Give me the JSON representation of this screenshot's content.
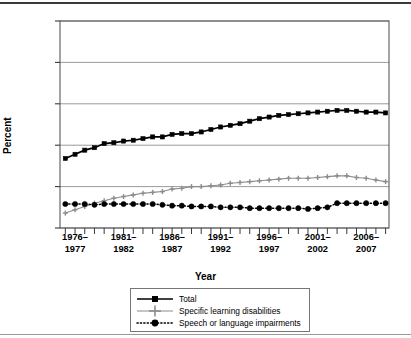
{
  "chart_data": {
    "type": "line",
    "title": "",
    "xlabel": "Year",
    "ylabel": "Percent",
    "ylim": [
      0,
      25
    ],
    "yticks": [
      0,
      5,
      10,
      15,
      20,
      25
    ],
    "grid": "horizontal",
    "legend_position": "below-plot",
    "x_tick_labels": [
      {
        "line1": "1976–",
        "line2": "1977"
      },
      {
        "line1": "1981–",
        "line2": "1982"
      },
      {
        "line1": "1986–",
        "line2": "1987"
      },
      {
        "line1": "1991–",
        "line2": "1992"
      },
      {
        "line1": "1996–",
        "line2": "1997"
      },
      {
        "line1": "2001–",
        "line2": "2002"
      },
      {
        "line1": "2006–",
        "line2": "2007"
      }
    ],
    "x": [
      "1975-76",
      "1976-77",
      "1977-78",
      "1978-79",
      "1979-80",
      "1980-81",
      "1981-82",
      "1982-83",
      "1983-84",
      "1984-85",
      "1985-86",
      "1986-87",
      "1987-88",
      "1988-89",
      "1989-90",
      "1990-91",
      "1991-92",
      "1992-93",
      "1993-94",
      "1994-95",
      "1995-96",
      "1996-97",
      "1997-98",
      "1998-99",
      "1999-2000",
      "2000-01",
      "2001-02",
      "2002-03",
      "2003-04",
      "2004-05",
      "2005-06",
      "2006-07",
      "2007-08",
      "2008-09"
    ],
    "series": [
      {
        "name": "Total",
        "marker": "square",
        "color": "#000000",
        "dash": "solid",
        "values": [
          8.4,
          8.9,
          9.4,
          9.7,
          10.2,
          10.3,
          10.5,
          10.6,
          10.8,
          11.0,
          11.0,
          11.3,
          11.4,
          11.4,
          11.6,
          11.9,
          12.2,
          12.4,
          12.6,
          12.9,
          13.2,
          13.4,
          13.6,
          13.7,
          13.8,
          13.9,
          14.0,
          14.1,
          14.2,
          14.2,
          14.1,
          14.0,
          14.0,
          13.9
        ]
      },
      {
        "name": "Specific learning disabilities",
        "marker": "plus",
        "color": "#8c8c8c",
        "dash": "solid",
        "values": [
          1.8,
          2.2,
          2.6,
          3.0,
          3.3,
          3.6,
          3.8,
          4.0,
          4.2,
          4.3,
          4.4,
          4.7,
          4.8,
          5.0,
          5.0,
          5.1,
          5.2,
          5.4,
          5.5,
          5.6,
          5.7,
          5.8,
          5.9,
          6.0,
          6.0,
          6.0,
          6.1,
          6.2,
          6.3,
          6.3,
          6.1,
          6.0,
          5.8,
          5.6
        ]
      },
      {
        "name": "Speech or language impairments",
        "marker": "circle",
        "color": "#000000",
        "dash": "dotted",
        "values": [
          2.9,
          2.9,
          2.9,
          2.8,
          2.9,
          2.9,
          2.9,
          2.9,
          2.9,
          2.9,
          2.8,
          2.7,
          2.7,
          2.6,
          2.6,
          2.6,
          2.5,
          2.5,
          2.5,
          2.4,
          2.4,
          2.4,
          2.4,
          2.4,
          2.4,
          2.3,
          2.4,
          2.5,
          3.0,
          3.0,
          3.0,
          3.0,
          3.0,
          3.0
        ]
      }
    ]
  },
  "legend": {
    "items": [
      {
        "label": "Total"
      },
      {
        "label": "Specific learning disabilities"
      },
      {
        "label": "Speech or language impairments"
      }
    ]
  }
}
